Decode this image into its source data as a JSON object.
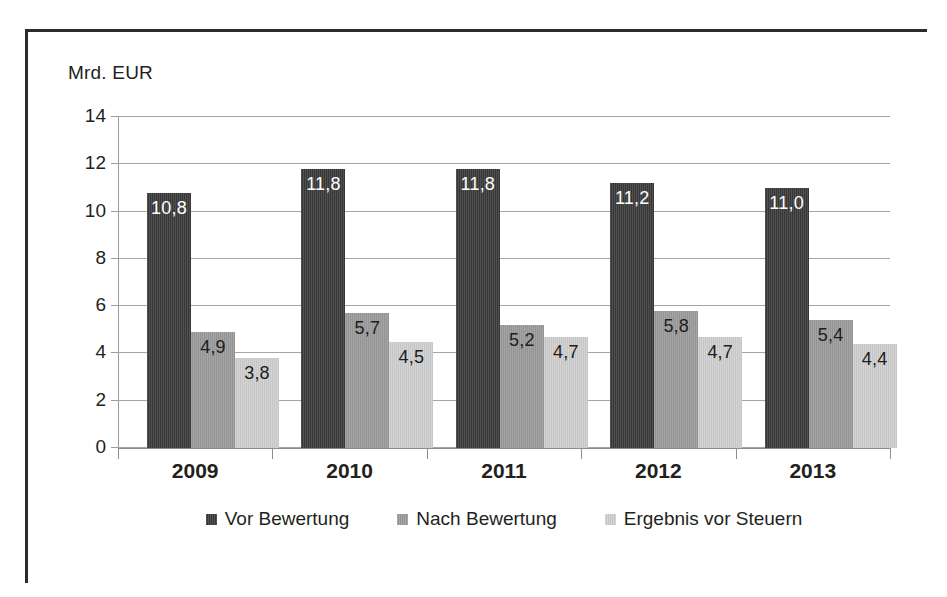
{
  "axis_title": "Mrd. EUR",
  "colors": {
    "series1": "#3a3a3a",
    "series2": "#9a9a9a",
    "series3": "#cfcfcf",
    "gridline": "#a6a6a6",
    "axis": "#8d8d8d",
    "text": "#231f20",
    "frame": "#2b2b2b"
  },
  "chart_data": {
    "type": "bar",
    "title": "",
    "xlabel": "",
    "ylabel": "Mrd. EUR",
    "ylim": [
      0,
      14
    ],
    "yticks": [
      0,
      2,
      4,
      6,
      8,
      10,
      12,
      14
    ],
    "ytick_labels": [
      "0",
      "2",
      "4",
      "6",
      "8",
      "10",
      "12",
      "14"
    ],
    "grid": true,
    "legend_position": "bottom",
    "categories": [
      "2009",
      "2010",
      "2011",
      "2012",
      "2013"
    ],
    "series": [
      {
        "name": "Vor Bewertung",
        "color": "#3a3a3a",
        "values": [
          10.8,
          11.8,
          11.8,
          11.2,
          11.0
        ],
        "labels": [
          "10,8",
          "11,8",
          "11,8",
          "11,2",
          "11,0"
        ],
        "label_color": "light"
      },
      {
        "name": "Nach Bewertung",
        "color": "#9a9a9a",
        "values": [
          4.9,
          5.7,
          5.2,
          5.8,
          5.4
        ],
        "labels": [
          "4,9",
          "5,7",
          "5,2",
          "5,8",
          "5,4"
        ],
        "label_color": "dark"
      },
      {
        "name": "Ergebnis vor Steuern",
        "color": "#cfcfcf",
        "values": [
          3.8,
          4.5,
          4.7,
          4.7,
          4.4
        ],
        "labels": [
          "3,8",
          "4,5",
          "4,7",
          "4,7",
          "4,4"
        ],
        "label_color": "dark"
      }
    ]
  }
}
